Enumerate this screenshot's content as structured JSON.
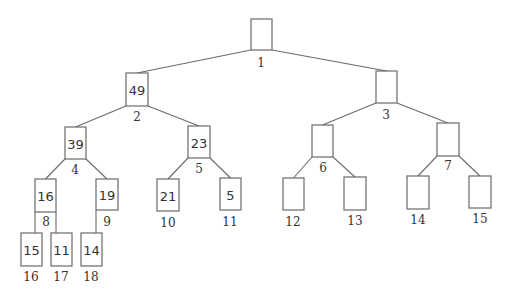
{
  "diagram": {
    "type": "binary-heap-tree",
    "nodes": [
      {
        "index": "1",
        "value": "",
        "x": 251,
        "y": 19,
        "w": 21,
        "h": 31,
        "lx": 261,
        "ly": 63
      },
      {
        "index": "2",
        "value": "49",
        "x": 126,
        "y": 73,
        "w": 22,
        "h": 33,
        "lx": 137,
        "ly": 117
      },
      {
        "index": "3",
        "value": "",
        "x": 376,
        "y": 71,
        "w": 21,
        "h": 32,
        "lx": 386,
        "ly": 115
      },
      {
        "index": "4",
        "value": "39",
        "x": 65,
        "y": 127,
        "w": 21,
        "h": 32,
        "lx": 75,
        "ly": 170
      },
      {
        "index": "5",
        "value": "23",
        "x": 188,
        "y": 126,
        "w": 22,
        "h": 32,
        "lx": 199,
        "ly": 169
      },
      {
        "index": "6",
        "value": "",
        "x": 312,
        "y": 125,
        "w": 21,
        "h": 32,
        "lx": 323,
        "ly": 168
      },
      {
        "index": "7",
        "value": "",
        "x": 437,
        "y": 123,
        "w": 22,
        "h": 33,
        "lx": 448,
        "ly": 166
      },
      {
        "index": "8",
        "value": "16",
        "x": 35,
        "y": 179,
        "w": 21,
        "h": 33,
        "lx": 46,
        "ly": 222
      },
      {
        "index": "9",
        "value": "19",
        "x": 96,
        "y": 179,
        "w": 22,
        "h": 31,
        "lx": 107,
        "ly": 222
      },
      {
        "index": "10",
        "value": "21",
        "x": 157,
        "y": 179,
        "w": 22,
        "h": 32,
        "lx": 168,
        "ly": 223
      },
      {
        "index": "11",
        "value": "5",
        "x": 220,
        "y": 178,
        "w": 21,
        "h": 32,
        "lx": 230,
        "ly": 222
      },
      {
        "index": "12",
        "value": "",
        "x": 283,
        "y": 178,
        "w": 21,
        "h": 32,
        "lx": 293,
        "ly": 222
      },
      {
        "index": "13",
        "value": "",
        "x": 344,
        "y": 177,
        "w": 22,
        "h": 33,
        "lx": 355,
        "ly": 221
      },
      {
        "index": "14",
        "value": "",
        "x": 407,
        "y": 176,
        "w": 22,
        "h": 33,
        "lx": 418,
        "ly": 220
      },
      {
        "index": "15",
        "value": "",
        "x": 469,
        "y": 176,
        "w": 22,
        "h": 32,
        "lx": 480,
        "ly": 219
      },
      {
        "index": "16",
        "value": "15",
        "x": 21,
        "y": 233,
        "w": 21,
        "h": 33,
        "lx": 31,
        "ly": 277
      },
      {
        "index": "17",
        "value": "11",
        "x": 51,
        "y": 233,
        "w": 21,
        "h": 33,
        "lx": 61,
        "ly": 277
      },
      {
        "index": "18",
        "value": "14",
        "x": 81,
        "y": 233,
        "w": 21,
        "h": 33,
        "lx": 91,
        "ly": 277
      }
    ],
    "edges": [
      [
        1,
        2
      ],
      [
        1,
        3
      ],
      [
        2,
        4
      ],
      [
        2,
        5
      ],
      [
        3,
        6
      ],
      [
        3,
        7
      ],
      [
        4,
        8
      ],
      [
        4,
        9
      ],
      [
        5,
        10
      ],
      [
        5,
        11
      ],
      [
        6,
        12
      ],
      [
        6,
        13
      ],
      [
        7,
        14
      ],
      [
        7,
        15
      ],
      [
        8,
        16
      ],
      [
        8,
        17
      ],
      [
        9,
        18
      ]
    ],
    "colors": {
      "stroke": "#6a6a6a",
      "text": "#333333",
      "background": "#ffffff"
    }
  }
}
